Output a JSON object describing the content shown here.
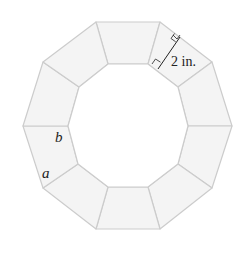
{
  "diagram": {
    "type": "decagonal-frame",
    "segment_count": 10,
    "colors": {
      "fill": "#f4f4f4",
      "stroke": "#cccccc",
      "inner_fill": "#ffffff",
      "annotation": "#222222"
    },
    "outer_vertices": [
      [
        96,
        22
      ],
      [
        160,
        22
      ],
      [
        212,
        62
      ],
      [
        232,
        126
      ],
      [
        212,
        188
      ],
      [
        160,
        229
      ],
      [
        96,
        229
      ],
      [
        43,
        188
      ],
      [
        23,
        126
      ],
      [
        43,
        62
      ]
    ],
    "inner_vertices": [
      [
        108,
        64
      ],
      [
        148,
        64
      ],
      [
        178,
        87
      ],
      [
        188,
        126
      ],
      [
        178,
        164
      ],
      [
        148,
        187
      ],
      [
        108,
        187
      ],
      [
        78,
        164
      ],
      [
        68,
        126
      ],
      [
        79,
        87
      ]
    ],
    "labels": {
      "width": "2 in.",
      "side_a": "a",
      "side_b": "b"
    }
  }
}
